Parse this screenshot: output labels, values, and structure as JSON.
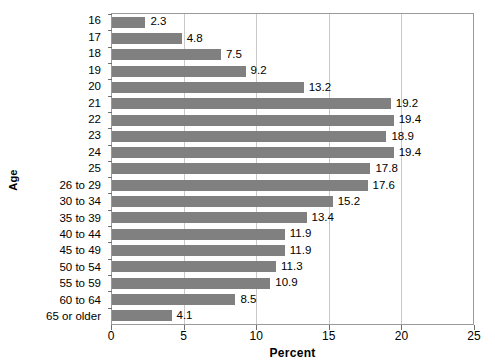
{
  "chart_data": {
    "type": "bar",
    "orientation": "horizontal",
    "title": "",
    "xlabel": "Percent",
    "ylabel": "Age",
    "xlim": [
      0,
      25
    ],
    "xticks": [
      0,
      5,
      10,
      15,
      20,
      25
    ],
    "xtick_labels": [
      "0",
      "5",
      "10",
      "15",
      "20",
      "25"
    ],
    "grid": "vertical",
    "legend": "none",
    "bar_color": "#808080",
    "frame_color": "#9a9a9a",
    "gridline_color": "#c9c9c9",
    "categories": [
      "16",
      "17",
      "18",
      "19",
      "20",
      "21",
      "22",
      "23",
      "24",
      "25",
      "26 to 29",
      "30 to 34",
      "35 to 39",
      "40 to 44",
      "45 to 49",
      "50 to 54",
      "55 to 59",
      "60 to 64",
      "65 or older"
    ],
    "values": [
      2.3,
      4.8,
      7.5,
      9.2,
      13.2,
      19.2,
      19.4,
      18.9,
      19.4,
      17.8,
      17.6,
      15.2,
      13.4,
      11.9,
      11.9,
      11.3,
      10.9,
      8.5,
      4.1
    ],
    "value_labels": [
      "2.3",
      "4.8",
      "7.5",
      "9.2",
      "13.2",
      "19.2",
      "19.4",
      "18.9",
      "19.4",
      "17.8",
      "17.6",
      "15.2",
      "13.4",
      "11.9",
      "11.9",
      "11.3",
      "10.9",
      "8.5",
      "4.1"
    ]
  }
}
